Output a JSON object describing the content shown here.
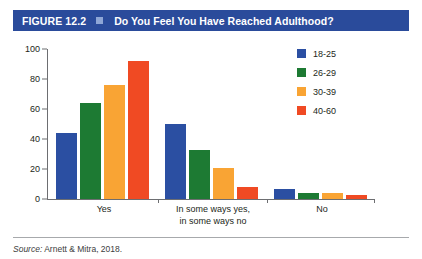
{
  "header": {
    "figure_number": "FIGURE 12.2",
    "separator_icon": "square-bullet-icon",
    "title": "Do You Feel You Have Reached Adulthood?",
    "banner_color": "#2a4b9b",
    "separator_color": "#8ea6d6"
  },
  "footer": {
    "source_word": "Source:",
    "source_text": " Arnett & Mitra, 2018."
  },
  "chart_data": {
    "type": "bar",
    "title": "Do You Feel You Have Reached Adulthood?",
    "xlabel": "",
    "ylabel": "",
    "ylim": [
      0,
      100
    ],
    "yticks": [
      0,
      20,
      40,
      60,
      80,
      100
    ],
    "ytick_labels": [
      "0",
      "20",
      "40",
      "60",
      "80",
      "100"
    ],
    "grid": false,
    "legend_position": "right",
    "categories": [
      "Yes",
      "In some ways yes,\nin some ways no",
      "No"
    ],
    "series": [
      {
        "name": "18-25",
        "color": "#2b4fa2",
        "values": [
          44,
          50,
          7
        ]
      },
      {
        "name": "26-29",
        "color": "#1d7a33",
        "values": [
          64,
          33,
          4
        ]
      },
      {
        "name": "30-39",
        "color": "#f9a434",
        "values": [
          76,
          21,
          4
        ]
      },
      {
        "name": "40-60",
        "color": "#f04a23",
        "values": [
          92,
          8,
          3
        ]
      }
    ]
  }
}
